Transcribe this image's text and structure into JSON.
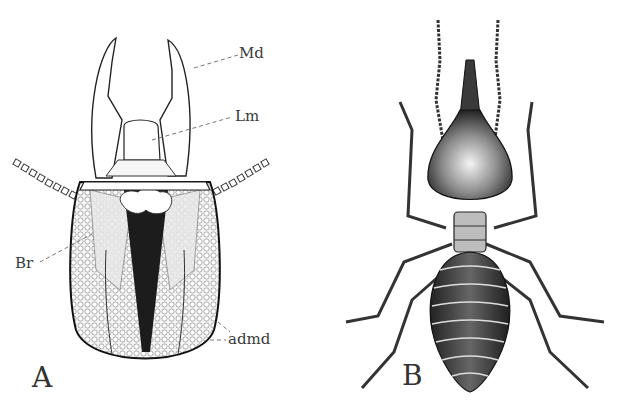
{
  "figure": {
    "panels": [
      {
        "letter": "A",
        "subject": "termite soldier head, dorsal view (dissected)"
      },
      {
        "letter": "B",
        "subject": "nasute termite soldier, dorsal view"
      }
    ],
    "labels": {
      "md": "Md",
      "lm": "Lm",
      "br": "Br",
      "admd": "admd"
    },
    "colors": {
      "ink": "#2a2a2a",
      "background": "#ffffff"
    }
  }
}
